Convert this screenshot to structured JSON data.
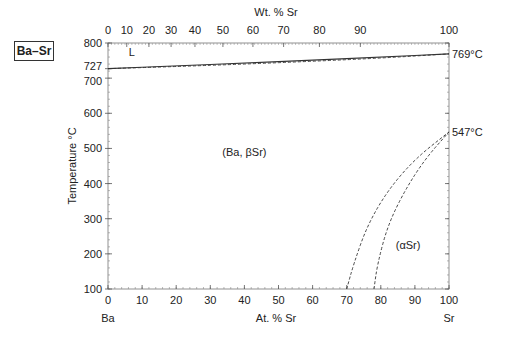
{
  "chart_data": {
    "type": "line",
    "title": "Ba–Sr",
    "xlabel": "At. % Sr",
    "x2label": "Wt. % Sr",
    "ylabel": "Temperature °C",
    "xlim": [
      0,
      100
    ],
    "ylim": [
      100,
      800
    ],
    "grid": false,
    "x_ticks": [
      0,
      10,
      20,
      30,
      40,
      50,
      60,
      70,
      80,
      90,
      100
    ],
    "x_tick_labels": [
      "0",
      "10",
      "20",
      "30",
      "40",
      "50",
      "60",
      "70",
      "80",
      "90",
      "100"
    ],
    "y_ticks": [
      100,
      200,
      300,
      400,
      500,
      600,
      700,
      727,
      800
    ],
    "y_tick_labels": [
      "100",
      "200",
      "300",
      "400",
      "500",
      "600",
      "700",
      "727",
      "800"
    ],
    "wt_ticks_at": [
      0,
      5.5,
      12,
      18.5,
      25.5,
      33.7,
      42.5,
      51.5,
      62,
      74,
      100
    ],
    "wt_tick_labels": [
      "0",
      "10",
      "20",
      "30",
      "40",
      "50",
      "60",
      "70",
      "80",
      "90",
      "100"
    ],
    "endpoint_left": "Ba",
    "endpoint_right": "Sr",
    "annotations": [
      {
        "text": "769°C",
        "x": 100,
        "y": 769
      },
      {
        "text": "547°C",
        "x": 100,
        "y": 547
      },
      {
        "text": "L",
        "x": 7,
        "y": 775
      },
      {
        "text": "(Ba, βSr)",
        "x": 40,
        "y": 490
      },
      {
        "text": "(αSr)",
        "x": 88,
        "y": 225
      }
    ],
    "series": [
      {
        "name": "liquidus",
        "style": "solid",
        "x": [
          0,
          20,
          40,
          60,
          80,
          100
        ],
        "y": [
          727,
          735,
          743,
          751,
          760,
          769
        ]
      },
      {
        "name": "solidus",
        "style": "dashed",
        "x": [
          0,
          20,
          40,
          60,
          80,
          100
        ],
        "y": [
          727,
          733,
          740,
          748,
          757,
          769
        ]
      },
      {
        "name": "beta-alpha boundary 1",
        "style": "dashed",
        "x": [
          70,
          72,
          76,
          82,
          90,
          100
        ],
        "y": [
          100,
          170,
          280,
          380,
          470,
          547
        ]
      },
      {
        "name": "beta-alpha boundary 2",
        "style": "dashed",
        "x": [
          78,
          79,
          82,
          87,
          93,
          100
        ],
        "y": [
          100,
          170,
          280,
          380,
          470,
          547
        ]
      }
    ]
  }
}
